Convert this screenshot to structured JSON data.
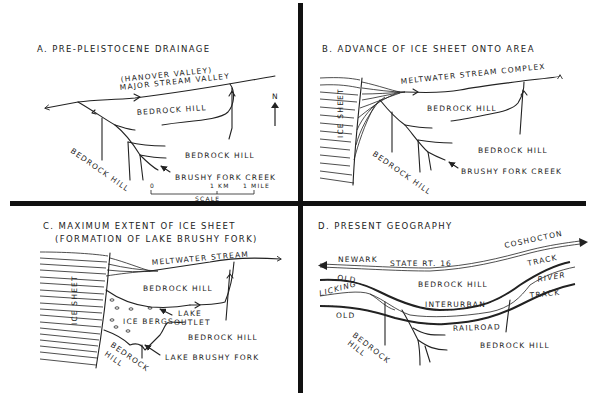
{
  "figure": {
    "panels": [
      {
        "id": "A",
        "title": "A. PRE-PLEISTOCENE DRAINAGE",
        "labels": {
          "hanover": "(HANOVER VALLEY)",
          "major_valley": "MAJOR STREAM VALLEY",
          "hill_1": "BEDROCK HILL",
          "hill_2": "BEDROCK HILL",
          "hill_3": "BEDROCK HILL",
          "creek": "BRUSHY FORK CREEK",
          "north": "N"
        },
        "scale": {
          "zero": "0",
          "km": "1 KM",
          "mile": "1 MILE",
          "label": "SCALE"
        }
      },
      {
        "id": "B",
        "title": "B. ADVANCE OF ICE SHEET ONTO AREA",
        "labels": {
          "stream": "MELTWATER STREAM COMPLEX",
          "ice": "ICE SHEET",
          "hill_1": "BEDROCK HILL",
          "hill_2": "BEDROCK HILL",
          "hill_3": "BEDROCK HILL",
          "creek": "BRUSHY FORK CREEK"
        }
      },
      {
        "id": "C",
        "title_line1": "C. MAXIMUM EXTENT OF ICE SHEET",
        "title_line2": "(FORMATION OF LAKE BRUSHY FORK)",
        "labels": {
          "stream": "MELTWATER STREAM",
          "ice": "ICE SHEET",
          "hill_1": "BEDROCK HILL",
          "hill_2": "BEDROCK HILL",
          "hill_3_a": "BEDROCK",
          "hill_3_b": "HILL",
          "lake_outlet_a": "LAKE",
          "lake_outlet_b": "OUTLET",
          "icebergs": "ICE BERGS",
          "lake": "LAKE BRUSHY FORK"
        }
      },
      {
        "id": "D",
        "title": "D. PRESENT GEOGRAPHY",
        "labels": {
          "coshocton": "COSHOCTON",
          "newark": "NEWARK",
          "route": "STATE RT. 16",
          "track_1": "TRACK",
          "old_1": "OLD",
          "licking": "LICKING",
          "river": "RIVER",
          "hill_1": "BEDROCK HILL",
          "interurban": "INTERURBAN",
          "track_2": "TRACK",
          "old_2": "OLD",
          "railroad": "RAILROAD",
          "hill_2_a": "BEDROCK",
          "hill_2_b": "HILL",
          "hill_3": "BEDROCK HILL"
        }
      }
    ]
  }
}
